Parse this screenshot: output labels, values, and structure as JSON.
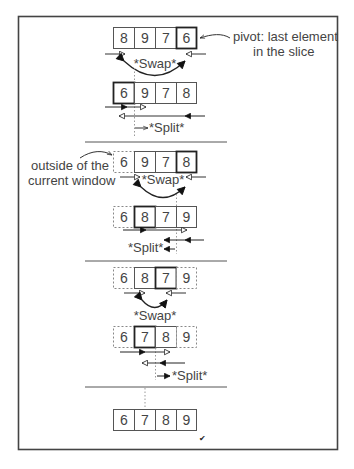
{
  "diagram": {
    "colors": {
      "frame": "#444444",
      "cell_border": "#555555",
      "pivot_border": "#222222",
      "text": "#444444",
      "arrow": "#222222",
      "dotted": "#888888"
    },
    "annotations": {
      "pivot_note_line1": "pivot: last element",
      "pivot_note_line2": "in the slice",
      "outside_note_line1": "outside of the",
      "outside_note_line2": "current window",
      "checkmark": "✔"
    },
    "labels": {
      "swap": "*Swap*",
      "split": "*Split*"
    },
    "steps": [
      {
        "id": "step1",
        "array": [
          "8",
          "9",
          "7",
          "6"
        ],
        "pivot_index": 3,
        "outside": [],
        "action": "Swap"
      },
      {
        "id": "step2",
        "array": [
          "6",
          "9",
          "7",
          "8"
        ],
        "pivot_index": 0,
        "outside": [],
        "action": "Split"
      },
      {
        "id": "step3",
        "array": [
          "6",
          "9",
          "7",
          "8"
        ],
        "pivot_index": 3,
        "outside": [
          0
        ],
        "action": "Swap"
      },
      {
        "id": "step4",
        "array": [
          "6",
          "8",
          "7",
          "9"
        ],
        "pivot_index": 1,
        "outside": [
          0
        ],
        "action": "Split"
      },
      {
        "id": "step5",
        "array": [
          "6",
          "8",
          "7",
          "9"
        ],
        "pivot_index": 2,
        "outside": [
          0,
          3
        ],
        "action": "Swap"
      },
      {
        "id": "step6",
        "array": [
          "6",
          "7",
          "8",
          "9"
        ],
        "pivot_index": 1,
        "outside": [
          0,
          3
        ],
        "action": "Split"
      },
      {
        "id": "final",
        "array": [
          "6",
          "7",
          "8",
          "9"
        ],
        "pivot_index": null,
        "outside": [],
        "action": "Done"
      }
    ]
  }
}
